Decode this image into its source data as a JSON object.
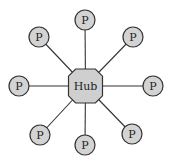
{
  "diagram": {
    "type": "star-topology",
    "hub": {
      "label": "Hub",
      "cx": 85.5,
      "cy": 86,
      "size": 34,
      "fill": "#cfcfcf",
      "stroke": "#333333"
    },
    "nodes": [
      {
        "id": "top",
        "label": "P",
        "cx": 85,
        "cy": 20
      },
      {
        "id": "top-right",
        "label": "P",
        "cx": 133,
        "cy": 37
      },
      {
        "id": "right",
        "label": "P",
        "cx": 153,
        "cy": 86
      },
      {
        "id": "bottom-right",
        "label": "P",
        "cx": 132,
        "cy": 134
      },
      {
        "id": "bottom",
        "label": "P",
        "cx": 85,
        "cy": 145
      },
      {
        "id": "bottom-left",
        "label": "P",
        "cx": 40,
        "cy": 135
      },
      {
        "id": "left",
        "label": "P",
        "cx": 19,
        "cy": 86
      },
      {
        "id": "top-left",
        "label": "P",
        "cx": 39,
        "cy": 37
      }
    ],
    "node_radius": 10,
    "node_fill": "#d3d3d3",
    "line_color": "#333333"
  }
}
